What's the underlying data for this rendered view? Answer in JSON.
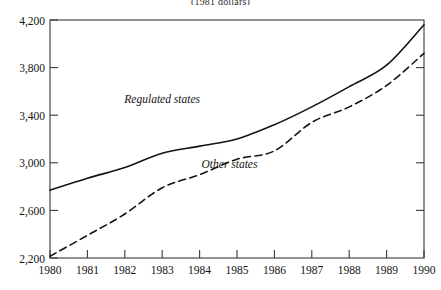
{
  "chart_data": {
    "type": "line",
    "title": "",
    "subtitle": "(1981 dollars)",
    "xlabel": "",
    "ylabel": "",
    "x": [
      1980,
      1981,
      1982,
      1983,
      1984,
      1985,
      1986,
      1987,
      1988,
      1989,
      1990
    ],
    "categories": [
      "1980",
      "1981",
      "1982",
      "1983",
      "1984",
      "1985",
      "1986",
      "1987",
      "1988",
      "1989",
      "1990"
    ],
    "xlim": [
      1980,
      1990
    ],
    "ylim": [
      2200,
      4200
    ],
    "yticks": [
      2200,
      2600,
      3000,
      3400,
      3800,
      4200
    ],
    "ytick_labels": [
      "2,200",
      "2,600",
      "3,000",
      "3,400",
      "3,800",
      "4,200"
    ],
    "xticks": [
      1980,
      1981,
      1982,
      1983,
      1984,
      1985,
      1986,
      1987,
      1988,
      1989,
      1990
    ],
    "xtick_labels": [
      "1980",
      "1981",
      "1982",
      "1983",
      "1984",
      "1985",
      "1986",
      "1987",
      "1988",
      "1989",
      "1990"
    ],
    "grid": false,
    "legend_position": "inline-annotations",
    "line_color": "#141414",
    "frame_color": "#3c3a38",
    "background": "#ffffff",
    "series": [
      {
        "name": "Regulated states",
        "style": "solid",
        "label_x": 1983.0,
        "label_y": 3500,
        "values": [
          2770,
          2870,
          2960,
          3080,
          3140,
          3200,
          3320,
          3470,
          3640,
          3820,
          4160
        ]
      },
      {
        "name": "Other states",
        "style": "dashed",
        "label_x": 1984.8,
        "label_y": 2960,
        "values": [
          2215,
          2390,
          2570,
          2790,
          2900,
          3030,
          3100,
          3340,
          3470,
          3650,
          3920
        ]
      }
    ],
    "annotations": [
      {
        "text": "Regulated states",
        "x": 1983.0,
        "y": 3500
      },
      {
        "text": "Other states",
        "x": 1984.8,
        "y": 2960
      }
    ]
  }
}
